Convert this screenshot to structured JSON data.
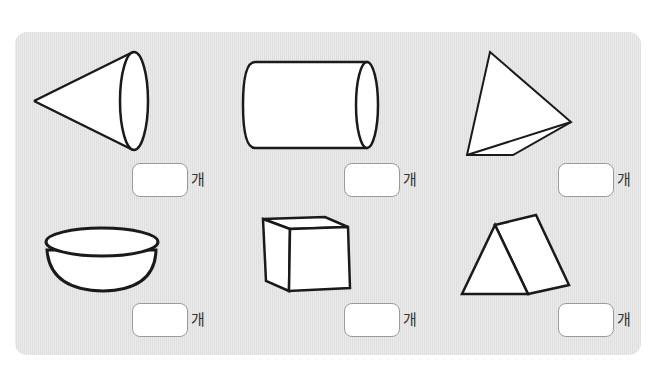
{
  "worksheet": {
    "unit_label": "개",
    "items": [
      {
        "shape": "cone",
        "answer_value": "",
        "unit": "개"
      },
      {
        "shape": "cylinder",
        "answer_value": "",
        "unit": "개"
      },
      {
        "shape": "triangular-pyramid",
        "answer_value": "",
        "unit": "개"
      },
      {
        "shape": "hemisphere",
        "answer_value": "",
        "unit": "개"
      },
      {
        "shape": "cube",
        "answer_value": "",
        "unit": "개"
      },
      {
        "shape": "triangular-prism",
        "answer_value": "",
        "unit": "개"
      }
    ]
  },
  "colors": {
    "panel": "#e6e6e6",
    "stroke": "#1a1a1a",
    "fill": "#ffffff",
    "box_border": "#9a9a9a"
  }
}
